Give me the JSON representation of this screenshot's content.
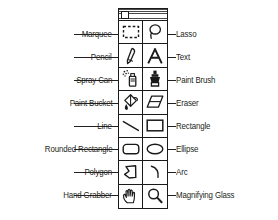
{
  "figure": {
    "kind": "tool-palette-diagram",
    "ink_color": "#231f20",
    "background": "#ffffff"
  },
  "palette": {
    "window_title": "",
    "close_box_label": "close-box",
    "columns": 2,
    "rows": 8
  },
  "tools": [
    {
      "row": 1,
      "left": {
        "label": "Marquee",
        "icon": "marquee-icon"
      },
      "right": {
        "label": "Lasso",
        "icon": "lasso-icon"
      }
    },
    {
      "row": 2,
      "left": {
        "label": "Pencil",
        "icon": "pencil-icon"
      },
      "right": {
        "label": "Text",
        "icon": "text-icon"
      }
    },
    {
      "row": 3,
      "left": {
        "label": "Spray Can",
        "icon": "spray-can-icon"
      },
      "right": {
        "label": "Paint Brush",
        "icon": "paint-brush-icon"
      }
    },
    {
      "row": 4,
      "left": {
        "label": "Paint Bucket",
        "icon": "paint-bucket-icon"
      },
      "right": {
        "label": "Eraser",
        "icon": "eraser-icon"
      }
    },
    {
      "row": 5,
      "left": {
        "label": "Line",
        "icon": "line-icon"
      },
      "right": {
        "label": "Rectangle",
        "icon": "rectangle-icon"
      }
    },
    {
      "row": 6,
      "left": {
        "label": "Rounded Rectangle",
        "icon": "rounded-rectangle-icon"
      },
      "right": {
        "label": "Ellipse",
        "icon": "ellipse-icon"
      }
    },
    {
      "row": 7,
      "left": {
        "label": "Polygon",
        "icon": "polygon-icon"
      },
      "right": {
        "label": "Arc",
        "icon": "arc-icon"
      }
    },
    {
      "row": 8,
      "left": {
        "label": "Hand Grabber",
        "icon": "hand-grabber-icon"
      },
      "right": {
        "label": "Magnifying Glass",
        "icon": "magnifying-glass-icon"
      }
    }
  ]
}
